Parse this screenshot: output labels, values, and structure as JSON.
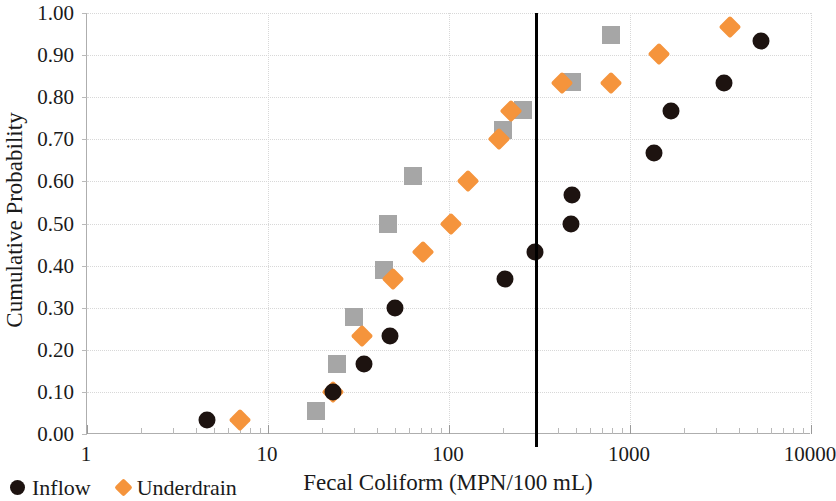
{
  "chart_data": {
    "type": "scatter",
    "title": "",
    "xlabel": "Fecal Coliform (MPN/100 mL)",
    "ylabel": "Cumulative Probability",
    "xscale": "log",
    "xlim": [
      1,
      10000
    ],
    "ylim": [
      0,
      1
    ],
    "xticks": [
      "1",
      "10",
      "100",
      "1000",
      "10000"
    ],
    "xtick_values": [
      1,
      10,
      100,
      1000,
      10000
    ],
    "yticks": [
      "0.00",
      "0.10",
      "0.20",
      "0.30",
      "0.40",
      "0.50",
      "0.60",
      "0.70",
      "0.80",
      "0.90",
      "1.00"
    ],
    "ytick_values": [
      0.0,
      0.1,
      0.2,
      0.3,
      0.4,
      0.5,
      0.6,
      0.7,
      0.8,
      0.9,
      1.0
    ],
    "grid": "horizontal-and-decade-vertical",
    "legend_position": "below-left",
    "annotations": [
      {
        "name": "water-quality-standard-line",
        "type": "vline",
        "x": 300,
        "color": "#000000"
      }
    ],
    "series": [
      {
        "name": "Inflow",
        "marker": "circle",
        "color": "#1d1310",
        "points": [
          {
            "x": 4.6,
            "y": 0.033
          },
          {
            "x": 23,
            "y": 0.1
          },
          {
            "x": 34,
            "y": 0.167
          },
          {
            "x": 47,
            "y": 0.233
          },
          {
            "x": 50,
            "y": 0.3
          },
          {
            "x": 205,
            "y": 0.367
          },
          {
            "x": 300,
            "y": 0.433
          },
          {
            "x": 470,
            "y": 0.5
          },
          {
            "x": 480,
            "y": 0.567
          },
          {
            "x": 1350,
            "y": 0.667
          },
          {
            "x": 1680,
            "y": 0.767
          },
          {
            "x": 3300,
            "y": 0.833
          },
          {
            "x": 5300,
            "y": 0.933
          }
        ]
      },
      {
        "name": "Underdrain",
        "marker": "diamond",
        "color": "#f5943c",
        "points": [
          {
            "x": 7.0,
            "y": 0.033
          },
          {
            "x": 23,
            "y": 0.1
          },
          {
            "x": 33,
            "y": 0.233
          },
          {
            "x": 49,
            "y": 0.367
          },
          {
            "x": 72,
            "y": 0.433
          },
          {
            "x": 103,
            "y": 0.5
          },
          {
            "x": 127,
            "y": 0.6
          },
          {
            "x": 190,
            "y": 0.7
          },
          {
            "x": 220,
            "y": 0.767
          },
          {
            "x": 420,
            "y": 0.833
          },
          {
            "x": 790,
            "y": 0.833
          },
          {
            "x": 1450,
            "y": 0.903
          },
          {
            "x": 3550,
            "y": 0.967
          }
        ]
      },
      {
        "name": "",
        "marker": "square",
        "color": "#a6a6a6",
        "points": [
          {
            "x": 18.5,
            "y": 0.055
          },
          {
            "x": 24,
            "y": 0.167
          },
          {
            "x": 30,
            "y": 0.277
          },
          {
            "x": 44,
            "y": 0.39
          },
          {
            "x": 46,
            "y": 0.5
          },
          {
            "x": 63,
            "y": 0.613
          },
          {
            "x": 200,
            "y": 0.723
          },
          {
            "x": 255,
            "y": 0.77
          },
          {
            "x": 480,
            "y": 0.837
          },
          {
            "x": 790,
            "y": 0.947
          }
        ]
      }
    ]
  },
  "axis": {
    "x_title": "Fecal Coliform (MPN/100 mL)",
    "y_title": "Cumulative Probability"
  },
  "legend": {
    "items": [
      {
        "label": "Inflow",
        "marker": "circle",
        "color": "#1d1310"
      },
      {
        "label": "Underdrain",
        "marker": "diamond",
        "color": "#f5943c"
      }
    ]
  },
  "colors": {
    "inflow": "#1d1310",
    "underdrain": "#f5943c",
    "third_series": "#a6a6a6",
    "threshold_line": "#000000",
    "gridline": "#d8d8d8",
    "axis": "#aeaeae",
    "text": "#1a1a1a",
    "background": "#ffffff"
  }
}
